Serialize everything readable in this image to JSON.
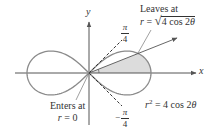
{
  "figure": {
    "axes": {
      "x_label": "x",
      "y_label": "y"
    },
    "annotations": {
      "leaves_line1": "Leaves at",
      "leaves_line2_lhs": "r",
      "leaves_line2_eq": " = ",
      "leaves_line2_rad": "4 cos 2",
      "leaves_line2_theta": "θ",
      "enters_line1": "Enters at",
      "enters_line2_lhs": "r",
      "enters_line2_rest": " = 0",
      "curve_eq_lhs": "r",
      "curve_eq_exp": "2",
      "curve_eq_rest": " = 4 cos 2",
      "curve_eq_theta": "θ",
      "angle_pos_num": "π",
      "angle_pos_den": "4",
      "angle_neg_sign": "−",
      "angle_neg_num": "π",
      "angle_neg_den": "4"
    },
    "colors": {
      "curve": "#8a8a8a",
      "axis": "#555555",
      "shade": "#dcdcdc",
      "dashed": "#333333",
      "text": "#333333"
    }
  },
  "chart_data": {
    "type": "polar-curve",
    "title": "",
    "equation": "r^2 = 4 cos 2θ",
    "a": 2,
    "origin_px": [
      89,
      73
    ],
    "px_per_unit": 31,
    "dashed_rays_deg": [
      45,
      -45
    ],
    "ray_deg": 21.7,
    "shaded_region": {
      "theta_from_deg": 0,
      "theta_to_deg": 21.7,
      "lobe": "right"
    },
    "labels": [
      "Leaves at r = √(4 cos 2θ)",
      "Enters at r = 0",
      "r^2 = 4 cos 2θ",
      "π/4",
      "−π/4"
    ]
  }
}
